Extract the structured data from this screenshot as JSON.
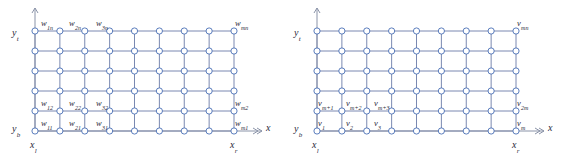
{
  "figure": {
    "type": "diagram",
    "grid": {
      "columns": 9,
      "rows": 6,
      "node_shape": "circle",
      "node_color": "#4a6fb5",
      "node_fill": "#ffffff",
      "line_color": "#6b7ca8",
      "axis_color": "#8a93a8"
    }
  },
  "panels": [
    {
      "id": "left",
      "name": "w-indexed-grid",
      "axes": {
        "x_arrow_label": "x",
        "y_top_label": "y",
        "y_top_sub": "t",
        "y_bottom_label": "y",
        "y_bottom_sub": "b",
        "x_left_label": "x",
        "x_left_sub": "l",
        "x_right_label": "x",
        "x_right_sub": "r"
      },
      "node_labels": [
        {
          "base": "w",
          "sub": "1n",
          "x": 41,
          "y": 19,
          "anchor": "start"
        },
        {
          "base": "w",
          "sub": "2n",
          "x": 69,
          "y": 19,
          "anchor": "start"
        },
        {
          "base": "w",
          "sub": "3n",
          "x": 96,
          "y": 19,
          "anchor": "start"
        },
        {
          "base": "w",
          "sub": "mn",
          "x": 235,
          "y": 19,
          "anchor": "start"
        },
        {
          "base": "w",
          "sub": "12",
          "x": 41,
          "y": 99,
          "anchor": "start"
        },
        {
          "base": "w",
          "sub": "22",
          "x": 69,
          "y": 99,
          "anchor": "start"
        },
        {
          "base": "w",
          "sub": "32",
          "x": 96,
          "y": 99,
          "anchor": "start"
        },
        {
          "base": "w",
          "sub": "m2",
          "x": 235,
          "y": 99,
          "anchor": "start"
        },
        {
          "base": "w",
          "sub": "11",
          "x": 41,
          "y": 119,
          "anchor": "start"
        },
        {
          "base": "w",
          "sub": "21",
          "x": 69,
          "y": 119,
          "anchor": "start"
        },
        {
          "base": "w",
          "sub": "31",
          "x": 96,
          "y": 119,
          "anchor": "start"
        },
        {
          "base": "w",
          "sub": "m1",
          "x": 235,
          "y": 119,
          "anchor": "start"
        }
      ]
    },
    {
      "id": "right",
      "name": "v-indexed-grid",
      "axes": {
        "x_arrow_label": "x",
        "y_top_label": "y",
        "y_top_sub": "t",
        "y_bottom_label": "y",
        "y_bottom_sub": "b",
        "x_left_label": "x",
        "x_left_sub": "l",
        "x_right_label": "x",
        "x_right_sub": "r"
      },
      "node_labels": [
        {
          "base": "v",
          "sub": "mn",
          "x": 235,
          "y": 19,
          "anchor": "start"
        },
        {
          "base": "v",
          "sub": "m+1",
          "x": 36,
          "y": 99,
          "anchor": "start"
        },
        {
          "base": "v",
          "sub": "m+2",
          "x": 64,
          "y": 99,
          "anchor": "start"
        },
        {
          "base": "v",
          "sub": "m+3",
          "x": 92,
          "y": 99,
          "anchor": "start"
        },
        {
          "base": "v",
          "sub": "2m",
          "x": 235,
          "y": 99,
          "anchor": "start"
        },
        {
          "base": "v",
          "sub": "1",
          "x": 36,
          "y": 119,
          "anchor": "start"
        },
        {
          "base": "v",
          "sub": "2",
          "x": 64,
          "y": 119,
          "anchor": "start"
        },
        {
          "base": "v",
          "sub": "3",
          "x": 92,
          "y": 119,
          "anchor": "start"
        },
        {
          "base": "v",
          "sub": "m",
          "x": 235,
          "y": 119,
          "anchor": "start"
        }
      ]
    }
  ],
  "geometry": {
    "grid_left_px": 35,
    "grid_right_px": 234,
    "grid_top_px": 31,
    "grid_bottom_px": 131,
    "col_step_px": 24.875,
    "row_step_px": 20,
    "node_radius_px": 3.1,
    "y_axis_x_px": 35,
    "y_axis_top_px": 8,
    "x_axis_y_px": 131,
    "x_axis_right_px": 262
  }
}
